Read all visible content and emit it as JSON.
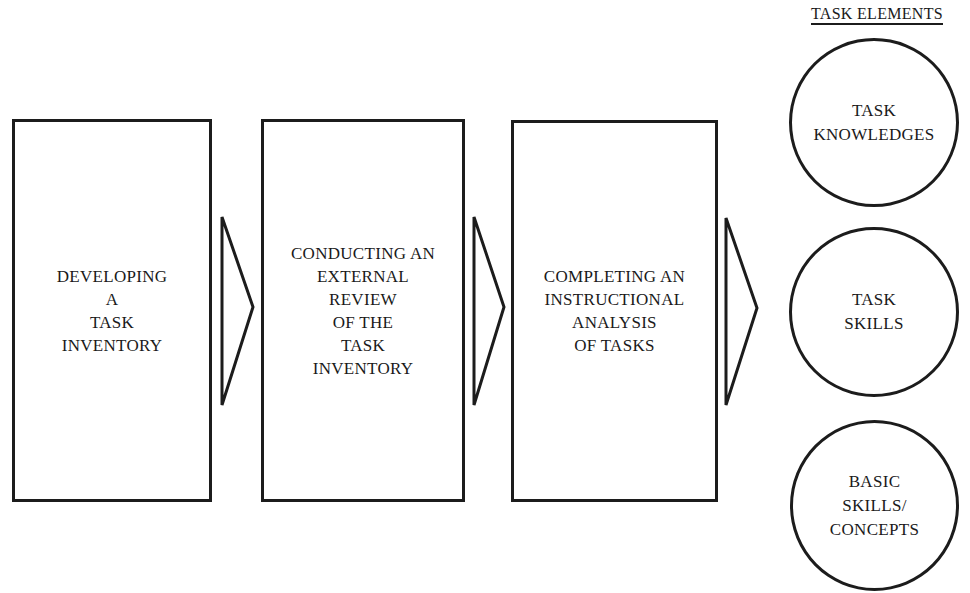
{
  "diagram": {
    "steps": [
      {
        "lines": [
          "DEVELOPING",
          "A",
          "TASK",
          "INVENTORY"
        ]
      },
      {
        "lines": [
          "CONDUCTING AN",
          "EXTERNAL",
          "REVIEW",
          "OF THE",
          "TASK",
          "INVENTORY"
        ]
      },
      {
        "lines": [
          "COMPLETING AN",
          "INSTRUCTIONAL",
          "ANALYSIS",
          "OF TASKS"
        ]
      }
    ],
    "task_elements": {
      "heading": "TASK ELEMENTS",
      "items": [
        {
          "lines": [
            "TASK",
            "KNOWLEDGES"
          ]
        },
        {
          "lines": [
            "TASK",
            "SKILLS"
          ]
        },
        {
          "lines": [
            "BASIC",
            "SKILLS/",
            "CONCEPTS"
          ]
        }
      ]
    },
    "colors": {
      "stroke": "#1c1c1c",
      "background": "#ffffff"
    }
  }
}
